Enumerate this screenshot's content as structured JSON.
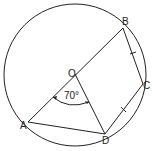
{
  "diagram": {
    "type": "circle-geometry",
    "circle": {
      "center_label": "O"
    },
    "points": [
      {
        "label": "O"
      },
      {
        "label": "A"
      },
      {
        "label": "B"
      },
      {
        "label": "C"
      },
      {
        "label": "D"
      }
    ],
    "angle": {
      "vertex": "O",
      "between": [
        "A",
        "D"
      ],
      "label": "70°"
    },
    "segments": [
      "AB (diameter through O)",
      "OD",
      "AD",
      "BC",
      "CD"
    ],
    "equal_marks": [
      "BC",
      "CD"
    ]
  },
  "labels": {
    "O": "O",
    "A": "A",
    "B": "B",
    "C": "C",
    "D": "D",
    "angle": "70°"
  }
}
